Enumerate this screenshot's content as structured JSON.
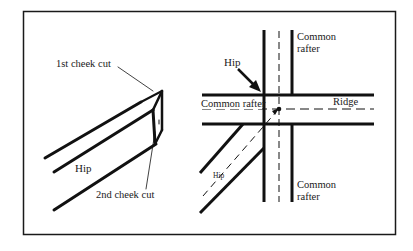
{
  "figure": {
    "width": 413,
    "height": 251,
    "frame_color": "#1a1a1a",
    "line_color": "#111111",
    "background": "#ffffff"
  },
  "left_diagram": {
    "labels": {
      "first_cheek_cut": "1st cheek cut",
      "second_cheek_cut": "2nd cheek cut",
      "hip": "Hip"
    }
  },
  "right_diagram": {
    "labels": {
      "common_rafter_top": [
        "Common",
        "rafter"
      ],
      "common_rafter_left": "Common rafter",
      "hip_arrow": "Hip",
      "ridge": "Ridge",
      "hip_inclined": "Hip",
      "common_rafter_bottom": [
        "Common",
        "rafter"
      ]
    }
  }
}
